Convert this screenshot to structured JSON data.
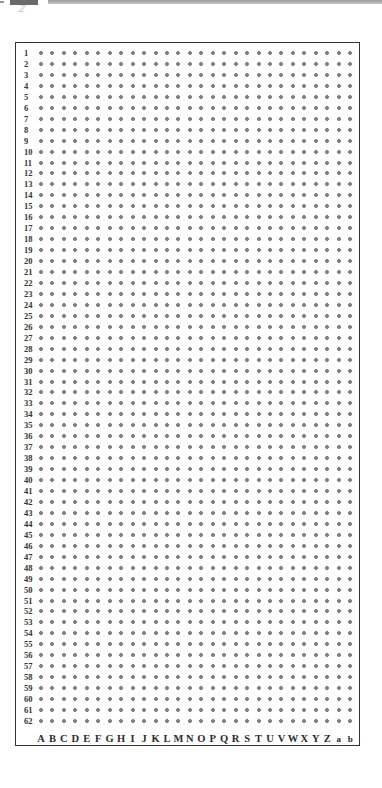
{
  "grid": {
    "rows": [
      "1",
      "2",
      "3",
      "4",
      "5",
      "6",
      "7",
      "8",
      "9",
      "10",
      "11",
      "12",
      "13",
      "14",
      "15",
      "16",
      "17",
      "18",
      "19",
      "20",
      "21",
      "22",
      "23",
      "24",
      "25",
      "26",
      "27",
      "28",
      "29",
      "30",
      "31",
      "32",
      "33",
      "34",
      "35",
      "36",
      "37",
      "38",
      "39",
      "40",
      "41",
      "42",
      "43",
      "44",
      "45",
      "46",
      "47",
      "48",
      "49",
      "50",
      "51",
      "52",
      "53",
      "54",
      "55",
      "56",
      "57",
      "58",
      "59",
      "60",
      "61",
      "62"
    ],
    "columns": [
      "A",
      "B",
      "C",
      "D",
      "E",
      "F",
      "G",
      "H",
      "I",
      "J",
      "K",
      "L",
      "M",
      "N",
      "O",
      "P",
      "Q",
      "R",
      "S",
      "T",
      "U",
      "V",
      "W",
      "X",
      "Y",
      "Z",
      "a",
      "b"
    ],
    "dot_color": "#8c8c8c",
    "frame_color": "#333333"
  },
  "corner": {
    "glyph": "ℤ"
  }
}
